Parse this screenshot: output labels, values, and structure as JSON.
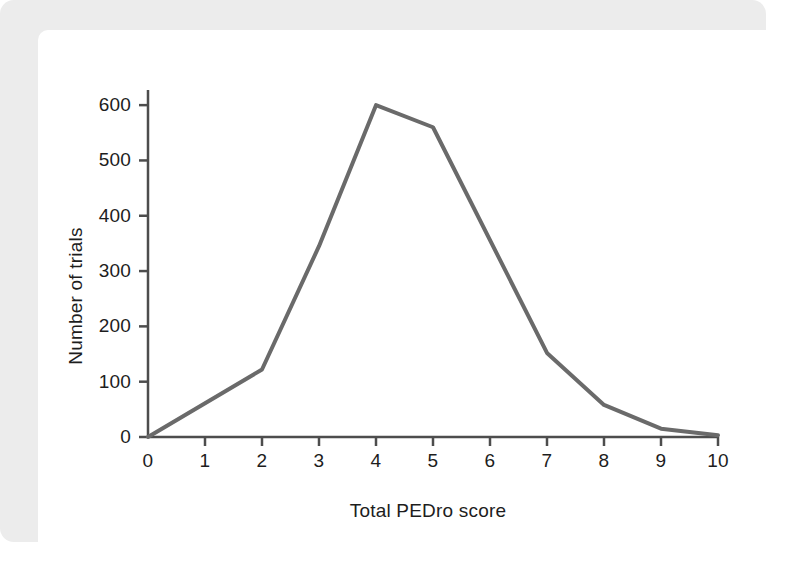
{
  "figure": {
    "background_color": "#ececec",
    "card_color": "#ffffff"
  },
  "chart_data": {
    "type": "line",
    "title": "",
    "subtitle": "",
    "xlabel": "Total PEDro score",
    "ylabel": "Number of trials",
    "x": [
      0,
      1,
      2,
      3,
      4,
      5,
      6,
      7,
      8,
      9,
      10
    ],
    "xticklabels": [
      "0",
      "1",
      "2",
      "3",
      "4",
      "5",
      "6",
      "7",
      "8",
      "9",
      "10"
    ],
    "yticks": [
      0,
      100,
      200,
      300,
      400,
      500,
      600
    ],
    "yticklabels": [
      "0",
      "100",
      "200",
      "300",
      "400",
      "500",
      "600"
    ],
    "xlim": [
      0,
      10
    ],
    "ylim": [
      0,
      640
    ],
    "grid": false,
    "legend": false,
    "series": [
      {
        "name": "Number of trials",
        "color": "#6a6a6a",
        "line_width": 4,
        "points": [
          {
            "x": 0,
            "y": 0
          },
          {
            "x": 2,
            "y": 122
          },
          {
            "x": 3,
            "y": 345
          },
          {
            "x": 4,
            "y": 600
          },
          {
            "x": 5,
            "y": 560
          },
          {
            "x": 7,
            "y": 152
          },
          {
            "x": 8,
            "y": 58
          },
          {
            "x": 9,
            "y": 15
          },
          {
            "x": 10,
            "y": 3
          }
        ],
        "values": [
          0,
          61,
          122,
          345,
          600,
          560,
          356,
          152,
          58,
          15,
          3
        ]
      }
    ],
    "axis_color": "#4d4d4d",
    "tick_color": "#1d1d1d"
  }
}
